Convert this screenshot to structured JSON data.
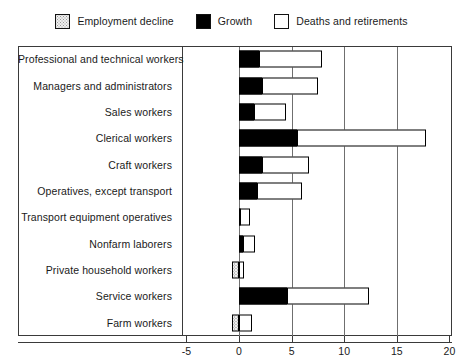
{
  "chart_data": {
    "type": "bar",
    "orientation": "horizontal",
    "stacked": true,
    "title": "",
    "xlabel": "",
    "ylabel": "",
    "xlim": [
      -6.5,
      20
    ],
    "xticks": [
      -5,
      0,
      5,
      10,
      15,
      20
    ],
    "xticklabels": [
      "-5",
      "0",
      "5",
      "10",
      "15",
      "20"
    ],
    "grid": true,
    "legend_position": "top-center",
    "categories": [
      "Professional and technical workers",
      "Managers and administrators",
      "Sales workers",
      "Clerical workers",
      "Craft workers",
      "Operatives, except transport",
      "Transport equipment operatives",
      "Nonfarm laborers",
      "Private household workers",
      "Service workers",
      "Farm workers"
    ],
    "series": [
      {
        "name": "Employment decline",
        "color": "#eeeeee",
        "values": [
          0,
          0,
          0,
          0,
          0,
          0,
          0,
          0,
          -0.7,
          0,
          -0.7
        ]
      },
      {
        "name": "Growth",
        "color": "#000000",
        "values": [
          1.9,
          2.2,
          1.4,
          5.5,
          2.2,
          1.7,
          0.1,
          0.4,
          0,
          4.6,
          0
        ]
      },
      {
        "name": "Deaths and retirements",
        "color": "#ffffff",
        "values": [
          6.0,
          5.3,
          3.1,
          12.3,
          4.5,
          4.3,
          0.9,
          1.1,
          0.5,
          7.8,
          1.2
        ]
      }
    ],
    "totals_positive": [
      7.9,
      7.5,
      4.5,
      17.8,
      6.7,
      6.0,
      1.0,
      1.5,
      0.5,
      12.4,
      1.2
    ]
  },
  "legend": {
    "items": [
      {
        "label": "Employment decline",
        "icon": "swatch-hatched"
      },
      {
        "label": "Growth",
        "icon": "swatch-solid-black"
      },
      {
        "label": "Deaths and retirements",
        "icon": "swatch-white"
      }
    ]
  }
}
